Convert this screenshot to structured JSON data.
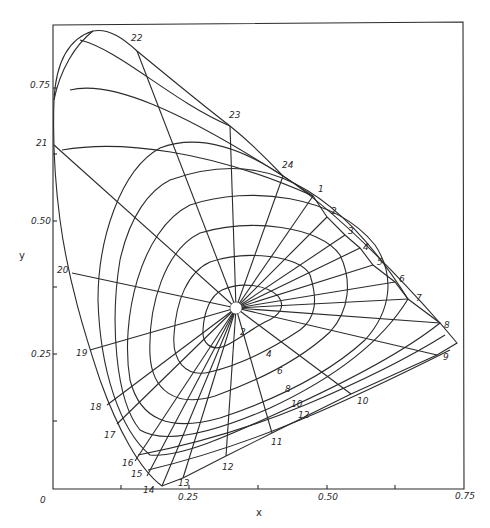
{
  "chart_data": {
    "type": "line",
    "title": "",
    "xlabel": "x",
    "ylabel": "y",
    "xlim": [
      0,
      0.75
    ],
    "ylim": [
      0,
      0.83
    ],
    "grid": false,
    "x_ticks": [
      0,
      0.125,
      0.25,
      0.375,
      0.5,
      0.625,
      0.75
    ],
    "x_tick_labels": [
      "0",
      "",
      "0.25",
      "",
      "0.50",
      "",
      "0.75"
    ],
    "y_ticks": [
      0.125,
      0.25,
      0.375,
      0.5,
      0.625,
      0.75
    ],
    "y_tick_labels": [
      "",
      "0.25",
      "",
      "0.50",
      "",
      "0.75"
    ],
    "white_point": {
      "x": 0.335,
      "y": 0.335
    },
    "spectrum_locus_labels": [
      {
        "label": "1",
        "x": 0.475,
        "y": 0.52
      },
      {
        "label": "2",
        "x": 0.5,
        "y": 0.48
      },
      {
        "label": "3",
        "x": 0.535,
        "y": 0.45
      },
      {
        "label": "4",
        "x": 0.56,
        "y": 0.42
      },
      {
        "label": "5",
        "x": 0.585,
        "y": 0.39
      },
      {
        "label": "6",
        "x": 0.625,
        "y": 0.355
      },
      {
        "label": "7",
        "x": 0.65,
        "y": 0.33
      },
      {
        "label": "8",
        "x": 0.705,
        "y": 0.29
      },
      {
        "label": "9",
        "x": 0.725,
        "y": 0.24
      },
      {
        "label": "10",
        "x": 0.55,
        "y": 0.16
      },
      {
        "label": "11",
        "x": 0.4,
        "y": 0.08
      },
      {
        "label": "12",
        "x": 0.315,
        "y": 0.04
      },
      {
        "label": "13",
        "x": 0.24,
        "y": 0.01
      },
      {
        "label": "14",
        "x": 0.185,
        "y": 0.005
      },
      {
        "label": "15",
        "x": 0.165,
        "y": 0.03
      },
      {
        "label": "16",
        "x": 0.15,
        "y": 0.055
      },
      {
        "label": "17",
        "x": 0.12,
        "y": 0.12
      },
      {
        "label": "18",
        "x": 0.09,
        "y": 0.17
      },
      {
        "label": "19",
        "x": 0.065,
        "y": 0.25
      },
      {
        "label": "20",
        "x": 0.035,
        "y": 0.39
      },
      {
        "label": "21",
        "x": 0.005,
        "y": 0.62
      },
      {
        "label": "22",
        "x": 0.15,
        "y": 0.82
      },
      {
        "label": "23",
        "x": 0.33,
        "y": 0.68
      },
      {
        "label": "24",
        "x": 0.42,
        "y": 0.58
      }
    ],
    "chroma_contour_labels": [
      "2",
      "4",
      "6",
      "8",
      "10",
      "12"
    ]
  },
  "axes": {
    "x_label": "x",
    "y_label": "y",
    "x_tick_text": {
      "t0": "0",
      "t025": "0.25",
      "t050": "0.50",
      "t075": "0.75"
    },
    "y_tick_text": {
      "t025": "0.25",
      "t050": "0.50",
      "t075": "0.75"
    }
  },
  "hue_lines": [
    {
      "label": "1",
      "end": [
        313,
        196
      ],
      "lx": 318,
      "ly": 192
    },
    {
      "label": "2",
      "end": [
        327,
        217
      ],
      "lx": 331,
      "ly": 214
    },
    {
      "label": "3",
      "end": [
        345,
        235
      ],
      "lx": 348,
      "ly": 234
    },
    {
      "label": "4",
      "end": [
        360,
        248
      ],
      "lx": 363,
      "ly": 250
    },
    {
      "label": "5",
      "end": [
        373,
        265
      ],
      "lx": 377,
      "ly": 265
    },
    {
      "label": "6",
      "end": [
        395,
        282
      ],
      "lx": 399,
      "ly": 282
    },
    {
      "label": "7",
      "end": [
        408,
        299
      ],
      "lx": 416,
      "ly": 301
    },
    {
      "label": "8",
      "end": [
        440,
        323
      ],
      "lx": 444,
      "ly": 328
    },
    {
      "label": "9",
      "end": [
        437,
        355
      ],
      "lx": 443,
      "ly": 360
    },
    {
      "label": "10",
      "end": [
        351,
        394
      ],
      "lx": 357,
      "ly": 404
    },
    {
      "label": "11",
      "end": [
        272,
        433
      ],
      "lx": 271,
      "ly": 445
    },
    {
      "label": "12",
      "end": [
        226,
        456
      ],
      "lx": 222,
      "ly": 470
    },
    {
      "label": "13",
      "end": [
        183,
        478
      ],
      "lx": 178,
      "ly": 486
    },
    {
      "label": "14",
      "end": [
        162,
        486
      ],
      "lx": 143,
      "ly": 493
    },
    {
      "label": "15",
      "end": [
        147,
        476
      ],
      "lx": 131,
      "ly": 477
    },
    {
      "label": "16",
      "end": [
        135,
        461
      ],
      "lx": 122,
      "ly": 466
    },
    {
      "label": "17",
      "end": [
        117,
        424
      ],
      "lx": 104,
      "ly": 438
    },
    {
      "label": "18",
      "end": [
        107,
        405
      ],
      "lx": 90,
      "ly": 410
    },
    {
      "label": "19",
      "end": [
        90,
        350
      ],
      "lx": 76,
      "ly": 356
    },
    {
      "label": "20",
      "end": [
        72,
        273
      ],
      "lx": 57,
      "ly": 273
    },
    {
      "label": "21",
      "end": [
        54,
        145
      ],
      "lx": 36,
      "ly": 146
    },
    {
      "label": "22",
      "end": [
        137,
        51
      ],
      "lx": 131,
      "ly": 41
    },
    {
      "label": "23",
      "end": [
        230,
        126
      ],
      "lx": 229,
      "ly": 118
    },
    {
      "label": "24",
      "end": [
        283,
        176
      ],
      "lx": 282,
      "ly": 168
    }
  ],
  "contour_labels": [
    {
      "label": "2",
      "x": 240,
      "y": 335
    },
    {
      "label": "4",
      "x": 266,
      "y": 357
    },
    {
      "label": "6",
      "x": 277,
      "y": 374
    },
    {
      "label": "8",
      "x": 285,
      "y": 392
    },
    {
      "label": "10",
      "x": 291,
      "y": 407
    },
    {
      "label": "12",
      "x": 298,
      "y": 418
    }
  ]
}
